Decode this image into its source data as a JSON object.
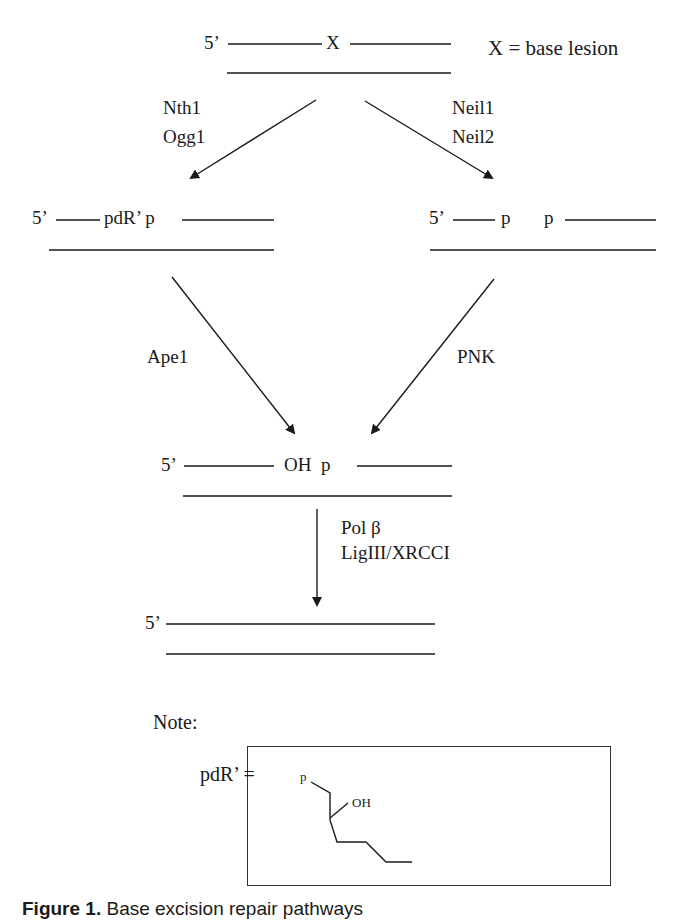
{
  "diagram": {
    "title": "Base excision repair pathway",
    "legend": "X = base lesion",
    "steps": {
      "start": {
        "five_prime": "5’",
        "lesion": "X"
      },
      "left_enzymes": [
        "Nth1",
        "Ogg1"
      ],
      "right_enzymes": [
        "Neil1",
        "Neil2"
      ],
      "left_intermediate": {
        "five_prime": "5’",
        "label": "pdR’ p"
      },
      "right_intermediate": {
        "five_prime": "5’",
        "label_a": "p",
        "label_b": "p"
      },
      "left_processing_enzyme": "Ape1",
      "right_processing_enzyme": "PNK",
      "merged_intermediate": {
        "five_prime": "5’",
        "label": "OH  p"
      },
      "final_enzymes": [
        "Pol β",
        "LigIII/XRCCI"
      ],
      "product": {
        "five_prime": "5’"
      }
    },
    "note": {
      "label": "Note:",
      "definition": "pdR’ =",
      "structure_labels": {
        "p": "p",
        "oh": "OH"
      }
    }
  },
  "caption": {
    "prefix": "Figure 1.",
    "text": "Base excision repair pathways"
  }
}
